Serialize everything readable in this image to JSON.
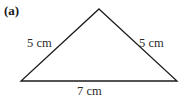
{
  "figure": {
    "part_label": "(a)",
    "shape": "isosceles-triangle",
    "stroke_color": "#1c1c1c",
    "background_color": "#ffffff",
    "text_color": "#2b2b2b",
    "vertices": {
      "apex": {
        "x": 99,
        "y": 9
      },
      "bottom_left": {
        "x": 21,
        "y": 81
      },
      "bottom_right": {
        "x": 177,
        "y": 81
      }
    },
    "labels": {
      "left_side": "5 cm",
      "right_side": "5 cm",
      "base": "7 cm"
    }
  }
}
